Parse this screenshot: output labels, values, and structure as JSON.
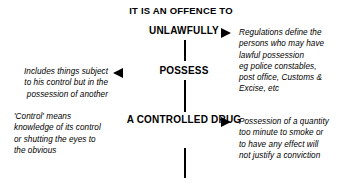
{
  "diagram": {
    "title": "IT IS AN OFFENCE TO",
    "stages": [
      {
        "id": "unlawfully",
        "label": "UNLAWFULLY"
      },
      {
        "id": "possess",
        "label": "POSSESS"
      },
      {
        "id": "controlled-drug",
        "line1": "A CONTROLLED",
        "line2": "DRUG"
      }
    ],
    "notes_right": [
      {
        "id": "note-regulations",
        "lines": [
          "Regulations define the",
          "persons who may have",
          "lawful possession",
          "eg police constables,",
          "post office, Customs &",
          "Excise, etc"
        ]
      },
      {
        "id": "note-quantity",
        "lines": [
          "Possession of a quantity",
          "too minute to smoke or",
          "to have any effect will",
          "not justify a conviction"
        ]
      }
    ],
    "notes_left": [
      {
        "id": "note-control-of-another",
        "lines": [
          "Includes things subject",
          "to his control but in the",
          "possession of another"
        ]
      },
      {
        "id": "note-control-meaning",
        "lines": [
          "'Control' means",
          "knowledge of its control",
          "or shutting the eyes to",
          "the obvious"
        ]
      }
    ],
    "icons": {
      "arrow_right": "arrow-right-icon",
      "arrow_left": "arrow-left-icon"
    },
    "colors": {
      "ink": "#000000",
      "background": "#ffffff"
    }
  }
}
